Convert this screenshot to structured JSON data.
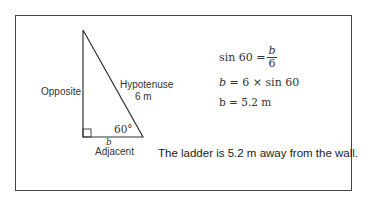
{
  "diagram": {
    "labels": {
      "opposite": "Opposite",
      "hypotenuse": "Hypotenuse",
      "hypotenuse_length": "6 m",
      "angle": "60°",
      "adjacent_var": "b",
      "adjacent": "Adjacent"
    },
    "colors": {
      "line": "#333333",
      "frame": "#444444"
    }
  },
  "equations": {
    "eq1_lhs": "sin 60 =",
    "eq1_num": "b",
    "eq1_den": "6",
    "eq2_var": "b",
    "eq2_rhs": "= 6 × sin 60",
    "eq3": "b = 5.2 m"
  },
  "conclusion": "The ladder is 5.2 m away from the wall."
}
